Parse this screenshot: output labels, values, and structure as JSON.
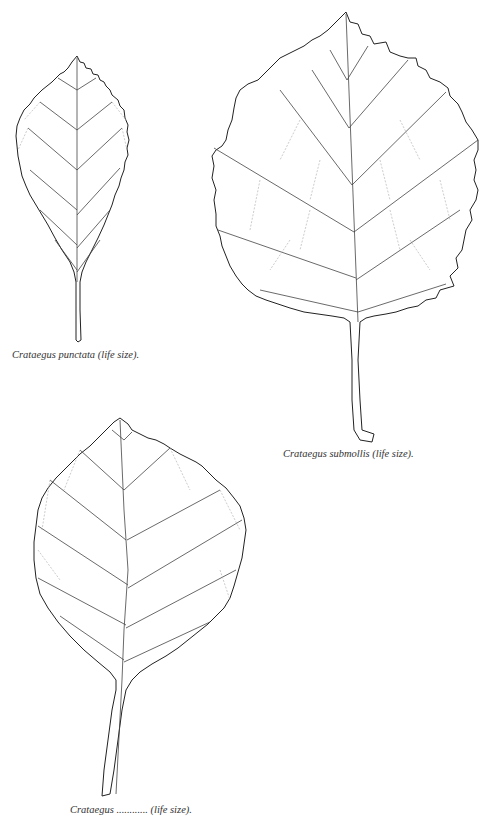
{
  "figures": [
    {
      "id": "punctata",
      "caption": "Crataegus punctata (life size).",
      "species": "Crataegus punctata"
    },
    {
      "id": "submollis",
      "caption": "Crataegus submollis (life size).",
      "species": "Crataegus submollis"
    },
    {
      "id": "third",
      "caption": "Crataegus ............ (life size).",
      "species": "Crataegus"
    }
  ]
}
